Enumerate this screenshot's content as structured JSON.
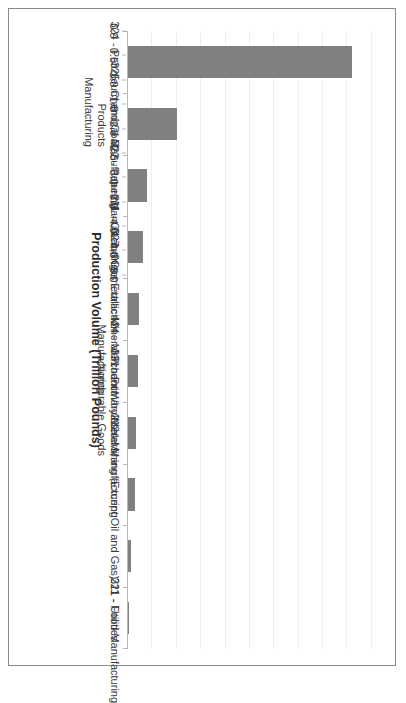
{
  "figure": {
    "orientation": "rotated-90-landscape-in-portrait",
    "background_color": "#ffffff",
    "border_color": "#8a8a8a",
    "bar_color": "#808080",
    "gridline_color": "#eceff1",
    "axis_color": "#b5b5b5"
  },
  "chart_data": {
    "type": "bar",
    "title": "",
    "xlabel": "",
    "ylabel": "Production Volume (Trillion Pounds)",
    "ylim": [
      0.0,
      5.25
    ],
    "yticks": [
      0.0,
      0.5,
      1.0,
      1.5,
      2.0,
      2.5,
      3.0,
      3.5,
      4.0,
      4.5,
      5.0
    ],
    "ytick_labels": [
      "0.0",
      "0.5",
      "1.0",
      "1.5",
      "2.0",
      "2.5",
      "3.0",
      "3.5",
      "4.0",
      "4.5",
      "5.0"
    ],
    "grid": true,
    "legend": null,
    "categories": [
      "324 - Petroleum and Coal Products Manufacturing",
      "325 - Chemical Manufacturing",
      "322 - Paper Manufacturing",
      "211 - Oil and Gas Extraction",
      "327 - Nonmetallic Mineral Product Manufacturing",
      "424 - Merchant Wholesalers, Nondurable Goods",
      "331 - Primary Metal Manufacturing",
      "212 - Mining (Except Oil and Gas)",
      "221 - Utilities",
      "311 - Food Manufacturing"
    ],
    "category_labels": [
      {
        "line1": "324 - Petroleum and Coal Products",
        "line2": "Manufacturing"
      },
      {
        "line1": "325 - Chemical Manufacturing",
        "line2": ""
      },
      {
        "line1": "322 - Paper Manufacturing",
        "line2": ""
      },
      {
        "line1": "211 - Oil and Gas Extraction",
        "line2": ""
      },
      {
        "line1": "327 - Nonmetallic Mineral Product",
        "line2": "Manufacturing"
      },
      {
        "line1": "424 - Merchant Wholesalers,",
        "line2": "Nondurable Goods"
      },
      {
        "line1": "331 - Primary Metal Manufacturing",
        "line2": ""
      },
      {
        "line1": "212 - Mining (Except Oil and Gas)",
        "line2": ""
      },
      {
        "line1": "221 - Utilities",
        "line2": ""
      },
      {
        "line1": "311 - Food Manufacturing",
        "line2": ""
      }
    ],
    "values": [
      4.6,
      1.0,
      0.38,
      0.3,
      0.23,
      0.21,
      0.17,
      0.15,
      0.07,
      0.02
    ]
  }
}
